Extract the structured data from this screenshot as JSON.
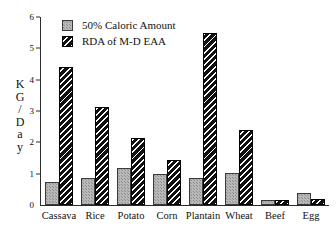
{
  "chart_data": {
    "type": "bar",
    "title": "",
    "xlabel": "",
    "ylabel": "KG/Day",
    "ylabel_letters": [
      "K",
      "G",
      "/",
      "D",
      "a",
      "y"
    ],
    "ylim": [
      0,
      6
    ],
    "yticks": [
      0,
      1,
      2,
      3,
      4,
      5,
      6
    ],
    "grid": false,
    "legend_position": "top-left",
    "categories": [
      "Cassava",
      "Rice",
      "Potato",
      "Corn",
      "Plantain",
      "Wheat",
      "Beef",
      "Egg"
    ],
    "series": [
      {
        "name": "50% Caloric Amount",
        "color": "#b8b8b8",
        "pattern": "stipple",
        "values": [
          0.72,
          0.86,
          1.19,
          1.0,
          0.85,
          1.03,
          0.15,
          0.37
        ]
      },
      {
        "name": "RDA of M-D EAA",
        "color": "#111111",
        "pattern": "diagonal-hatch",
        "values": [
          4.4,
          3.12,
          2.15,
          1.43,
          5.48,
          2.4,
          0.16,
          0.19
        ]
      }
    ]
  },
  "axis": {
    "y_tick_labels": [
      "0",
      "1",
      "2",
      "3",
      "4",
      "5",
      "6"
    ]
  }
}
